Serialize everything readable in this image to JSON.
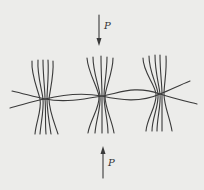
{
  "diagram": {
    "type": "weave-cross-section",
    "colors": {
      "background": "#ececea",
      "stroke": "#3a3a3a"
    },
    "force_top": {
      "label": "P",
      "direction": "down"
    },
    "force_bottom": {
      "label": "P",
      "direction": "up"
    },
    "bundles": [
      {
        "id": "left",
        "cross_point": [
          45,
          99
        ]
      },
      {
        "id": "middle",
        "cross_point": [
          102,
          96
        ]
      },
      {
        "id": "right",
        "cross_point": [
          160,
          94
        ]
      }
    ],
    "curves": 2
  }
}
